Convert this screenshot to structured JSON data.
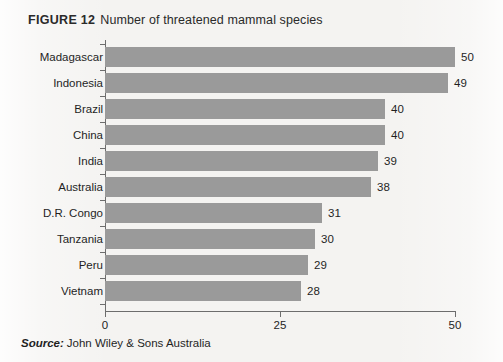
{
  "figure": {
    "label": "FIGURE 12",
    "title": "Number of threatened mammal species"
  },
  "source": {
    "label": "Source:",
    "text": "John Wiley & Sons Australia"
  },
  "colors": {
    "bar": "#9a9a9a",
    "axis": "#6d6d6d",
    "page_background": "#f4f3f1",
    "text": "#1f1f1f"
  },
  "chart_data": {
    "type": "bar",
    "orientation": "horizontal",
    "title": "Number of threatened mammal species",
    "xlabel": "",
    "ylabel": "",
    "xlim": [
      0,
      50
    ],
    "xticks": [
      0,
      25,
      50
    ],
    "xtick_labels": [
      "0",
      "25",
      "50"
    ],
    "grid": false,
    "legend": false,
    "data_labels": true,
    "categories": [
      "Madagascar",
      "Indonesia",
      "Brazil",
      "China",
      "India",
      "Australia",
      "D.R. Congo",
      "Tanzania",
      "Peru",
      "Vietnam"
    ],
    "values": [
      50,
      49,
      40,
      40,
      39,
      38,
      31,
      30,
      29,
      28
    ]
  }
}
